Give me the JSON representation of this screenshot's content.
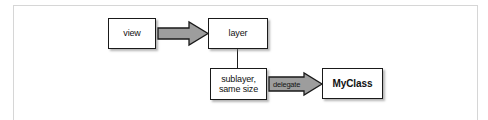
{
  "figure": {
    "type": "block-diagram",
    "background_color": "#ffffff",
    "frame_color": "#d6d6d6",
    "nodes": [
      {
        "id": "view",
        "label": "view",
        "bold": false
      },
      {
        "id": "layer",
        "label": "layer",
        "bold": false
      },
      {
        "id": "sublayer",
        "label": "sublayer,\nsame size",
        "bold": false
      },
      {
        "id": "myclass",
        "label": "MyClass",
        "bold": true
      }
    ],
    "connectors": [
      {
        "id": "view-to-layer",
        "from": "view",
        "to": "layer",
        "style": "block-arrow",
        "direction": "right",
        "label": "",
        "fill_color": "#9d9d9d",
        "stroke_color": "#1a1a1a"
      },
      {
        "id": "layer-to-sublayer",
        "from": "layer",
        "to": "sublayer",
        "style": "line",
        "direction": "down",
        "label": "",
        "stroke_color": "#1d1d1d"
      },
      {
        "id": "sublayer-to-myclass",
        "from": "sublayer",
        "to": "myclass",
        "style": "block-arrow",
        "direction": "right",
        "label": "delegate",
        "fill_color": "#9d9d9d",
        "stroke_color": "#1a1a1a"
      }
    ]
  }
}
